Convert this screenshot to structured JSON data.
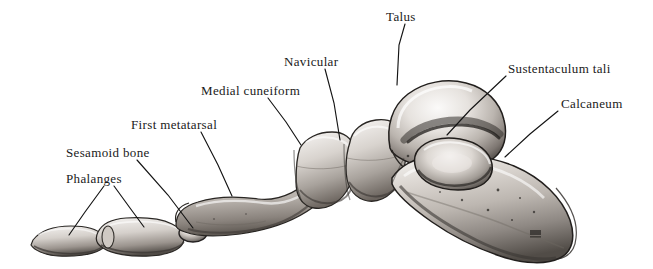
{
  "figure": {
    "background_color": "#ffffff",
    "ink_color": "#1a1a1a",
    "width": 653,
    "height": 269,
    "signature_mark": "artist-monogram"
  },
  "labels": [
    {
      "id": "talus",
      "text": "Talus",
      "x": 386,
      "y": 10,
      "leader": [
        [
          405,
          24
        ],
        [
          399,
          45
        ],
        [
          397,
          85
        ]
      ]
    },
    {
      "id": "sustentaculum-tali",
      "text": "Sustentaculum tali",
      "x": 508,
      "y": 62,
      "leader": [
        [
          506,
          76
        ],
        [
          470,
          110
        ],
        [
          447,
          135
        ]
      ]
    },
    {
      "id": "calcaneum",
      "text": "Calcaneum",
      "x": 561,
      "y": 97,
      "leader": [
        [
          558,
          111
        ],
        [
          530,
          134
        ],
        [
          505,
          157
        ]
      ]
    },
    {
      "id": "navicular",
      "text": "Navicular",
      "x": 284,
      "y": 55,
      "leader": [
        [
          325,
          69
        ],
        [
          334,
          103
        ],
        [
          340,
          140
        ]
      ]
    },
    {
      "id": "medial-cuneiform",
      "text": "Medial cuneiform",
      "x": 201,
      "y": 84,
      "leader": [
        [
          268,
          98
        ],
        [
          286,
          122
        ],
        [
          301,
          145
        ]
      ]
    },
    {
      "id": "first-metatarsal",
      "text": "First metatarsal",
      "x": 131,
      "y": 118,
      "leader": [
        [
          201,
          132
        ],
        [
          218,
          165
        ],
        [
          232,
          196
        ]
      ]
    },
    {
      "id": "sesamoid-bone",
      "text": "Sesamoid bone",
      "x": 66,
      "y": 146,
      "leader": [
        [
          137,
          160
        ],
        [
          168,
          195
        ],
        [
          193,
          228
        ]
      ]
    },
    {
      "id": "phalanges",
      "text": "Phalanges",
      "x": 66,
      "y": 172,
      "leader_a": [
        [
          104,
          186
        ],
        [
          85,
          212
        ],
        [
          69,
          235
        ]
      ],
      "leader_b": [
        [
          114,
          186
        ],
        [
          130,
          208
        ],
        [
          144,
          227
        ]
      ]
    }
  ],
  "bones": [
    {
      "id": "distal-phalanx",
      "name": "Distal phalanx of great toe"
    },
    {
      "id": "proximal-phalanx",
      "name": "Proximal phalanx of great toe"
    },
    {
      "id": "sesamoid",
      "name": "Sesamoid bone"
    },
    {
      "id": "first-metatarsal-bone",
      "name": "First metatarsal"
    },
    {
      "id": "medial-cuneiform-bone",
      "name": "Medial cuneiform"
    },
    {
      "id": "navicular-bone",
      "name": "Navicular"
    },
    {
      "id": "talus-bone",
      "name": "Talus"
    },
    {
      "id": "sustentaculum-tali-bone",
      "name": "Sustentaculum tali"
    },
    {
      "id": "calcaneum-bone",
      "name": "Calcaneum"
    }
  ]
}
